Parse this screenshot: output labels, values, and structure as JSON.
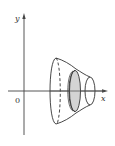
{
  "figure": {
    "labels": {
      "y_axis": "y",
      "x_axis": "x",
      "origin": "0"
    },
    "colors": {
      "stroke": "#333333",
      "disk_fill": "#d4d4d4",
      "background": "#ffffff"
    }
  }
}
